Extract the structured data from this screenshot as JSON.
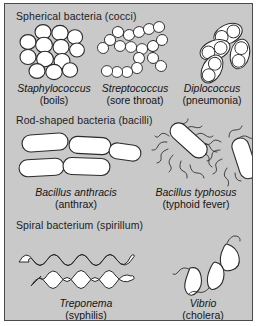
{
  "figure": {
    "background_color": "#c9c9c9",
    "outline_color": "#2b2b2b",
    "cell_fill_color": "#ffffff"
  },
  "sections": [
    {
      "id": "cocci",
      "heading": "Spherical bacteria (cocci)",
      "organisms": [
        {
          "genus": "Staphylococcus",
          "disease": "(boils)",
          "shape": "cluster"
        },
        {
          "genus": "Streptococcus",
          "disease": "(sore throat)",
          "shape": "chain"
        },
        {
          "genus": "Diplococcus",
          "disease": "(pneumonia)",
          "shape": "encapsulated-pair"
        }
      ]
    },
    {
      "id": "bacilli",
      "heading": "Rod-shaped bacteria (bacilli)",
      "organisms": [
        {
          "genus": "Bacillus anthracis",
          "disease": "(anthrax)",
          "shape": "rod"
        },
        {
          "genus": "Bacillus typhosus",
          "disease": "(typhoid fever)",
          "shape": "flagellated-rod"
        }
      ]
    },
    {
      "id": "spirillum",
      "heading": "Spiral bacterium (spirillum)",
      "organisms": [
        {
          "genus": "Treponema",
          "disease": "(syphilis)",
          "shape": "spirochete"
        },
        {
          "genus": "Vibrio",
          "disease": "(cholera)",
          "shape": "comma"
        }
      ]
    }
  ]
}
